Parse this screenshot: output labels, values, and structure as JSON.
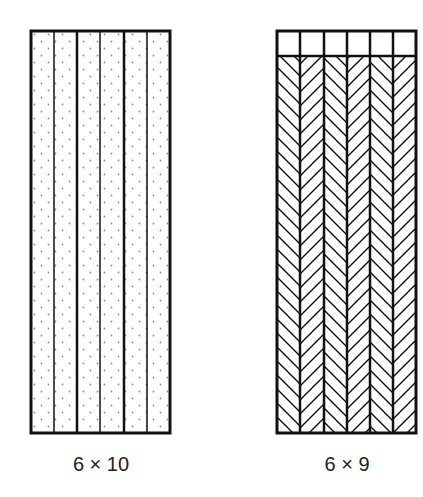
{
  "figures": [
    {
      "id": "left",
      "label": "6 × 10",
      "columns": 6,
      "fill": "dots",
      "header_row": false
    },
    {
      "id": "right",
      "label": "6 × 9",
      "columns": 6,
      "fill": "herringbone",
      "header_row": true
    }
  ],
  "colors": {
    "stroke": "#111111",
    "dot": "#8a8a8a",
    "background": "#ffffff"
  }
}
